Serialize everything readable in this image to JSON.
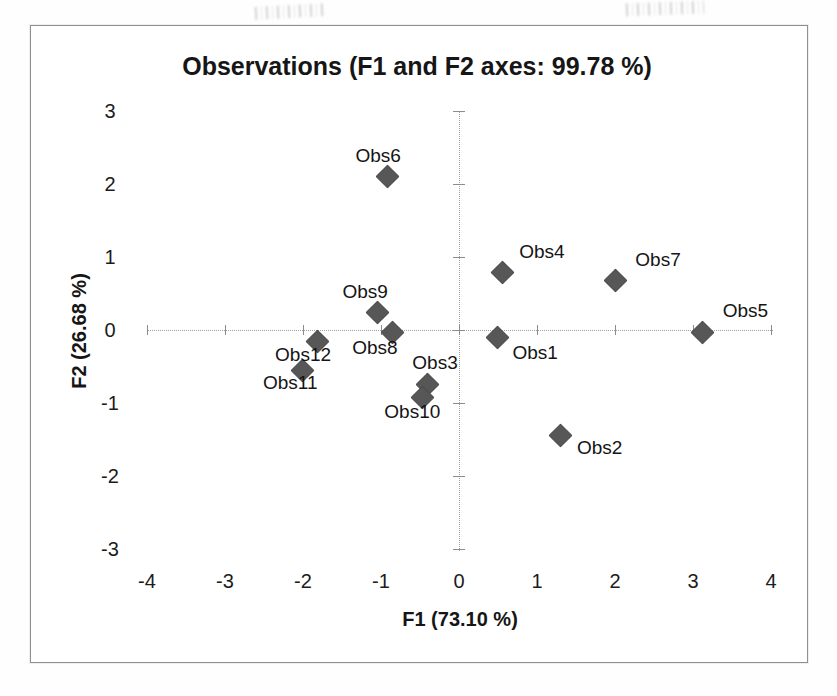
{
  "chart_data": {
    "type": "scatter",
    "title": "Observations (F1 and F2 axes: 99.78 %)",
    "xlabel": "F1 (73.10 %)",
    "ylabel": "F2 (26.68 %)",
    "xlim": [
      -4,
      4
    ],
    "ylim": [
      -3,
      3
    ],
    "x_ticks": [
      -4,
      -3,
      -2,
      -1,
      0,
      1,
      2,
      3,
      4
    ],
    "y_ticks": [
      -3,
      -2,
      -1,
      0,
      1,
      2,
      3
    ],
    "grid": false,
    "legend": false,
    "marker": "diamond",
    "marker_color": "#575757",
    "points": [
      {
        "label": "Obs1",
        "x": 0.49,
        "y": -0.1,
        "label_dx": 38,
        "label_dy": 16
      },
      {
        "label": "Obs2",
        "x": 1.29,
        "y": -1.44,
        "label_dx": 40,
        "label_dy": 13
      },
      {
        "label": "Obs3",
        "x": -0.41,
        "y": -0.74,
        "label_dx": 8,
        "label_dy": -21
      },
      {
        "label": "Obs4",
        "x": 0.55,
        "y": 0.8,
        "label_dx": 40,
        "label_dy": -20
      },
      {
        "label": "Obs5",
        "x": 3.12,
        "y": -0.03,
        "label_dx": 43,
        "label_dy": -21
      },
      {
        "label": "Obs6",
        "x": -0.92,
        "y": 2.11,
        "label_dx": -9,
        "label_dy": -20
      },
      {
        "label": "Obs7",
        "x": 2.0,
        "y": 0.68,
        "label_dx": 43,
        "label_dy": -20
      },
      {
        "label": "Obs8",
        "x": -0.86,
        "y": -0.03,
        "label_dx": -17,
        "label_dy": 16
      },
      {
        "label": "Obs9",
        "x": -1.05,
        "y": 0.24,
        "label_dx": -12,
        "label_dy": -20
      },
      {
        "label": "Obs10",
        "x": -0.47,
        "y": -0.92,
        "label_dx": -10,
        "label_dy": 15
      },
      {
        "label": "Obs11",
        "x": -2.01,
        "y": -0.55,
        "label_dx": -12,
        "label_dy": 13
      },
      {
        "label": "Obs12",
        "x": -1.82,
        "y": -0.15,
        "label_dx": -14,
        "label_dy": 14
      }
    ]
  }
}
